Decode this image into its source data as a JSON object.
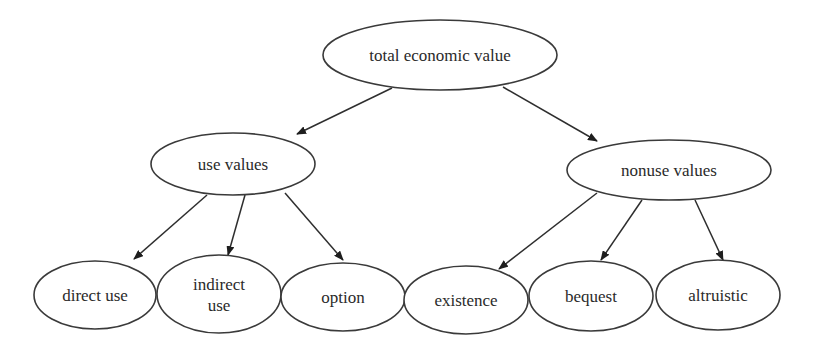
{
  "diagram": {
    "type": "tree",
    "colors": {
      "stroke": "#3a3a3a",
      "text": "#2a2a2a",
      "background": "#ffffff"
    },
    "nodes": [
      {
        "id": "tev",
        "lines": [
          "total economic value"
        ],
        "cx": 440,
        "cy": 55,
        "rx": 117,
        "ry": 35
      },
      {
        "id": "use",
        "lines": [
          "use values"
        ],
        "cx": 233,
        "cy": 164,
        "rx": 82,
        "ry": 31
      },
      {
        "id": "nonuse",
        "lines": [
          "nonuse values"
        ],
        "cx": 669,
        "cy": 170,
        "rx": 102,
        "ry": 30
      },
      {
        "id": "direct",
        "lines": [
          "direct use"
        ],
        "cx": 95,
        "cy": 295,
        "rx": 61,
        "ry": 34
      },
      {
        "id": "indirect",
        "lines": [
          "indirect",
          "use"
        ],
        "cx": 219,
        "cy": 294,
        "rx": 62,
        "ry": 39
      },
      {
        "id": "option",
        "lines": [
          "option"
        ],
        "cx": 343,
        "cy": 297,
        "rx": 62,
        "ry": 34
      },
      {
        "id": "existence",
        "lines": [
          "existence"
        ],
        "cx": 466,
        "cy": 300,
        "rx": 62,
        "ry": 34
      },
      {
        "id": "bequest",
        "lines": [
          "bequest"
        ],
        "cx": 591,
        "cy": 296,
        "rx": 62,
        "ry": 35
      },
      {
        "id": "altruistic",
        "lines": [
          "altruistic"
        ],
        "cx": 718,
        "cy": 295,
        "rx": 62,
        "ry": 35
      }
    ],
    "edges": [
      {
        "from": "tev",
        "to": "use",
        "x1": 392,
        "y1": 88,
        "x2": 297,
        "y2": 134
      },
      {
        "from": "tev",
        "to": "nonuse",
        "x1": 503,
        "y1": 87,
        "x2": 597,
        "y2": 141
      },
      {
        "from": "use",
        "to": "direct",
        "x1": 207,
        "y1": 195,
        "x2": 134,
        "y2": 259
      },
      {
        "from": "use",
        "to": "indirect",
        "x1": 245,
        "y1": 195,
        "x2": 228,
        "y2": 255
      },
      {
        "from": "use",
        "to": "option",
        "x1": 285,
        "y1": 193,
        "x2": 343,
        "y2": 260
      },
      {
        "from": "nonuse",
        "to": "existence",
        "x1": 597,
        "y1": 193,
        "x2": 499,
        "y2": 269
      },
      {
        "from": "nonuse",
        "to": "bequest",
        "x1": 642,
        "y1": 200,
        "x2": 601,
        "y2": 260
      },
      {
        "from": "nonuse",
        "to": "altruistic",
        "x1": 695,
        "y1": 200,
        "x2": 723,
        "y2": 260
      }
    ]
  }
}
